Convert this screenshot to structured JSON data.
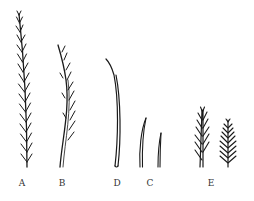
{
  "figure": {
    "labels": [
      {
        "id": "A",
        "text": "A",
        "x": 22
      },
      {
        "id": "B",
        "text": "B",
        "x": 62
      },
      {
        "id": "D",
        "text": "D",
        "x": 117
      },
      {
        "id": "C",
        "text": "C",
        "x": 150
      },
      {
        "id": "E",
        "text": "E",
        "x": 211
      }
    ],
    "ink_color": "#1a1a1a"
  }
}
